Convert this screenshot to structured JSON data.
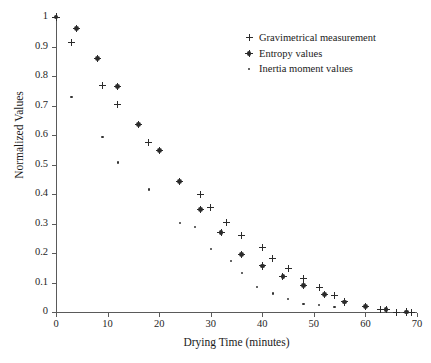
{
  "chart_data": {
    "type": "scatter",
    "title": "",
    "xlabel": "Drying Time (minutes)",
    "ylabel": "Normalized Values",
    "xlim": [
      0,
      70
    ],
    "ylim": [
      0,
      1
    ],
    "xticks": [
      "0",
      "10",
      "20",
      "30",
      "40",
      "50",
      "60",
      "70"
    ],
    "yticks": [
      "0",
      "0.1",
      "0.2",
      "0.3",
      "0.4",
      "0.5",
      "0.6",
      "0.7",
      "0.8",
      "0.9",
      "1"
    ],
    "grid": false,
    "legend_position": "upper right",
    "series": [
      {
        "name": "Gravimetrical measurement",
        "marker": "plus",
        "color": "#2b2b2b",
        "points": [
          [
            0,
            1.0
          ],
          [
            3,
            0.915
          ],
          [
            9,
            0.768
          ],
          [
            12,
            0.702
          ],
          [
            18,
            0.573
          ],
          [
            28,
            0.4
          ],
          [
            30,
            0.354
          ],
          [
            33,
            0.303
          ],
          [
            36,
            0.259
          ],
          [
            40,
            0.219
          ],
          [
            42,
            0.18
          ],
          [
            45,
            0.148
          ],
          [
            48,
            0.115
          ],
          [
            51,
            0.082
          ],
          [
            54,
            0.057
          ],
          [
            60,
            0.018
          ],
          [
            63,
            0.01
          ],
          [
            66,
            0.0
          ],
          [
            68,
            0.0
          ],
          [
            69,
            0.0
          ]
        ]
      },
      {
        "name": "Entropy values",
        "marker": "star",
        "color": "#2b2b2b",
        "points": [
          [
            0,
            1.0
          ],
          [
            4,
            0.961
          ],
          [
            8,
            0.859
          ],
          [
            12,
            0.765
          ],
          [
            16,
            0.635
          ],
          [
            20,
            0.548
          ],
          [
            24,
            0.442
          ],
          [
            28,
            0.348
          ],
          [
            32,
            0.27
          ],
          [
            36,
            0.196
          ],
          [
            40,
            0.156
          ],
          [
            44,
            0.12
          ],
          [
            48,
            0.089
          ],
          [
            52,
            0.06
          ],
          [
            56,
            0.034
          ],
          [
            60,
            0.019
          ],
          [
            64,
            0.008
          ],
          [
            68,
            0.0
          ]
        ]
      },
      {
        "name": "Inertia moment values",
        "marker": "dot",
        "color": "#343434",
        "points": [
          [
            3,
            0.73
          ],
          [
            9,
            0.594
          ],
          [
            12,
            0.507
          ],
          [
            18,
            0.415
          ],
          [
            24,
            0.302
          ],
          [
            27,
            0.288
          ],
          [
            30,
            0.214
          ],
          [
            34,
            0.173
          ],
          [
            36,
            0.131
          ],
          [
            39,
            0.086
          ],
          [
            42,
            0.063
          ],
          [
            45,
            0.044
          ],
          [
            48,
            0.027
          ],
          [
            51,
            0.024
          ],
          [
            54,
            0.018
          ]
        ]
      }
    ]
  },
  "axes": {
    "x_title": "Drying Time (minutes)",
    "y_title": "Normalized Values",
    "x_ticks": [
      "0",
      "10",
      "20",
      "30",
      "40",
      "50",
      "60",
      "70"
    ],
    "y_ticks": [
      "0",
      "0.1",
      "0.2",
      "0.3",
      "0.4",
      "0.5",
      "0.6",
      "0.7",
      "0.8",
      "0.9",
      "1"
    ]
  },
  "legend": {
    "items": [
      {
        "label": "Gravimetrical measurement",
        "marker": "plus-marker-icon"
      },
      {
        "label": "Entropy values",
        "marker": "star-marker-icon"
      },
      {
        "label": "Inertia moment values",
        "marker": "dot-marker-icon"
      }
    ]
  },
  "colors": {
    "marker": "#2b2b2b",
    "axis": "#5a5a5a",
    "text": "#1a1a1a",
    "background": "#ffffff"
  }
}
